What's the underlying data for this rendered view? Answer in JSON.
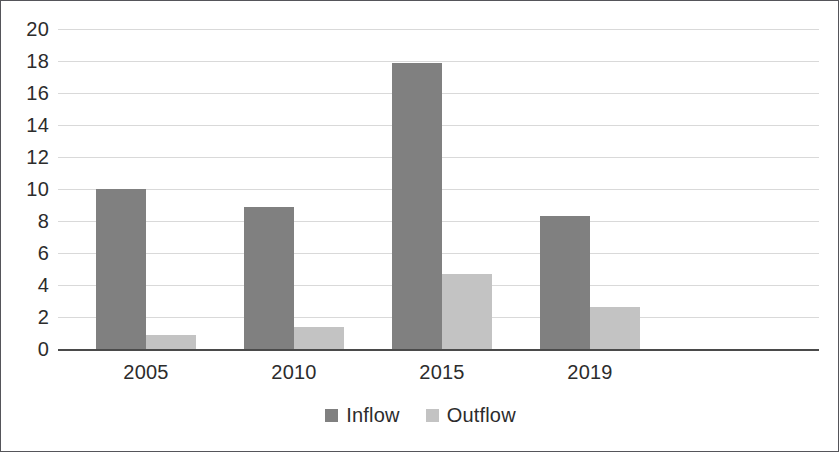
{
  "chart_data": {
    "type": "bar",
    "title": "",
    "subtitle": "",
    "xlabel": "",
    "ylabel": "",
    "categories": [
      "2005",
      "2010",
      "2015",
      "2019"
    ],
    "series": [
      {
        "name": "Inflow",
        "color": "#808080",
        "values": [
          10.0,
          8.9,
          17.9,
          8.3
        ]
      },
      {
        "name": "Outflow",
        "color": "#c3c3c3",
        "values": [
          0.9,
          1.4,
          4.7,
          2.65
        ]
      }
    ],
    "ylim": [
      0,
      20
    ],
    "y_tick_step": 2,
    "y_ticks": [
      "0",
      "2",
      "4",
      "6",
      "8",
      "10",
      "12",
      "14",
      "16",
      "18",
      "20"
    ],
    "grid": true,
    "grid_axis": "y",
    "legend_position": "bottom",
    "annotations": []
  },
  "legend": {
    "entries": [
      {
        "label": "Inflow",
        "swatch_color": "#808080"
      },
      {
        "label": "Outflow",
        "swatch_color": "#c3c3c3"
      }
    ]
  },
  "colors": {
    "frame_border": "#55555a",
    "axis_line": "#4a4a4a",
    "gridline": "#d9d9d9",
    "text": "#2c2c2c",
    "background": "#ffffff"
  }
}
